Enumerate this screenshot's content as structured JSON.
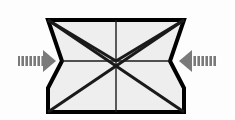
{
  "figure": {
    "name": "compression-deformation-diagram",
    "canvas": {
      "width": 235,
      "height": 120
    },
    "background_color": "#fdfdfd"
  },
  "colors": {
    "outline": "#000000",
    "body_fill": "#eeeeee",
    "inner_line": "#1a1a1a",
    "arrow_fill": "#7a7a7a",
    "arrow_hatch": "#ffffff",
    "background": "#fdfdfd"
  },
  "body_shape": {
    "name": "hourglass-block",
    "description": "Wide top edge pinching to a narrow waist then flaring to a straight-sided base",
    "outline_width": 4,
    "points": [
      {
        "label": "top-left",
        "x": 48,
        "y": 20
      },
      {
        "label": "top-right",
        "x": 184,
        "y": 20
      },
      {
        "label": "waist-right",
        "x": 170,
        "y": 61
      },
      {
        "label": "flare-right",
        "x": 184,
        "y": 88
      },
      {
        "label": "base-right",
        "x": 184,
        "y": 112
      },
      {
        "label": "base-left",
        "x": 48,
        "y": 112
      },
      {
        "label": "flare-left",
        "x": 48,
        "y": 88
      },
      {
        "label": "waist-left",
        "x": 62,
        "y": 61
      }
    ]
  },
  "inner_lines": [
    {
      "name": "vertical-centerline",
      "x1": 116,
      "y1": 20,
      "x2": 116,
      "y2": 112,
      "width": 1.4
    },
    {
      "name": "horizontal-waistline",
      "x1": 62,
      "y1": 61,
      "x2": 170,
      "y2": 61,
      "width": 1.4
    },
    {
      "name": "diagonal-topleft-to-bottomright",
      "x1": 48,
      "y1": 20,
      "x2": 184,
      "y2": 112,
      "width": 3
    },
    {
      "name": "diagonal-topright-to-bottomleft",
      "x1": 184,
      "y1": 20,
      "x2": 48,
      "y2": 112,
      "width": 3
    },
    {
      "name": "diagonal-topleft-to-waistleft",
      "x1": 48,
      "y1": 20,
      "x2": 116,
      "y2": 61,
      "width": 3
    },
    {
      "name": "diagonal-topright-to-waistright",
      "x1": 184,
      "y1": 20,
      "x2": 116,
      "y2": 61,
      "width": 3
    }
  ],
  "center_point": {
    "name": "diagonal-intersection",
    "x": 116,
    "y": 61
  },
  "arrows": [
    {
      "name": "left-compression-arrow",
      "direction": "right",
      "tail_x": 18,
      "tip_x": 56,
      "center_y": 61,
      "shaft_half_height": 5,
      "head_half_height": 11,
      "head_length": 13,
      "hatch_count": 6,
      "label": ""
    },
    {
      "name": "right-compression-arrow",
      "direction": "left",
      "tail_x": 217,
      "tip_x": 179,
      "center_y": 61,
      "shaft_half_height": 5,
      "head_half_height": 11,
      "head_length": 13,
      "hatch_count": 6,
      "label": ""
    }
  ]
}
